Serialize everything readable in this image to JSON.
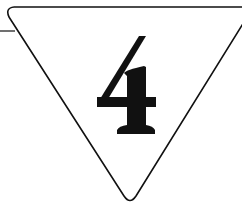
{
  "sign": {
    "shape": "inverted-triangle",
    "digit": "4",
    "stroke_color": "#111111",
    "fill_color": "#ffffff",
    "background_color": "#ffffff"
  }
}
